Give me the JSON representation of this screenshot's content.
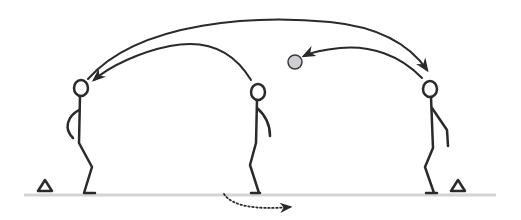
{
  "diagram": {
    "type": "sports-drill",
    "colors": {
      "background": "#ffffff",
      "line": "#2a2a2a",
      "ground": "#d4d4d4",
      "ball_fill": "#cfcfd3",
      "ball_stroke": "#3a3a3a"
    },
    "ground": {
      "x1": 24,
      "x2": 496,
      "y": 195
    },
    "players": [
      {
        "id": "player-left",
        "head": [
          87,
          88
        ],
        "pose": "left-arm-curved"
      },
      {
        "id": "player-middle",
        "head": [
          258,
          92
        ],
        "pose": "right-arm-bent"
      },
      {
        "id": "player-right",
        "head": [
          430,
          89
        ],
        "pose": "right-arm-bent"
      }
    ],
    "cones": [
      {
        "id": "cone-left",
        "x": 45,
        "y": 193
      },
      {
        "id": "cone-right",
        "x": 458,
        "y": 193
      }
    ],
    "ball": {
      "cx": 295,
      "cy": 62,
      "r": 7
    },
    "arrows": [
      {
        "id": "pass-long-left-to-right",
        "style": "solid",
        "from": "player-left",
        "to": "player-right"
      },
      {
        "id": "pass-middle-to-left",
        "style": "solid",
        "from": "player-middle",
        "to": "player-left"
      },
      {
        "id": "pass-right-to-ball",
        "style": "solid",
        "from": "player-right",
        "to": "ball"
      },
      {
        "id": "run-middle-player",
        "style": "dotted",
        "from": "player-middle",
        "to": "right"
      }
    ]
  }
}
